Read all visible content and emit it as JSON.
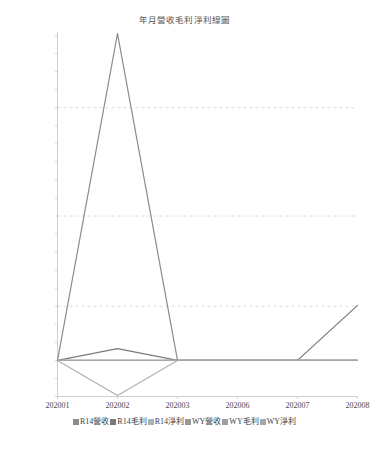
{
  "chart_data": {
    "type": "line",
    "title": "年月營收毛利淨利線圖",
    "xlabel": "",
    "ylabel": "",
    "categories": [
      "202001",
      "202002",
      "202003",
      "202006",
      "202007",
      "202008"
    ],
    "ylim": [
      -400000,
      3600000
    ],
    "ytick_step": 200000,
    "yticks": [
      3600000,
      3400000,
      3200000,
      3000000,
      2800000,
      2600000,
      2400000,
      2200000,
      2000000,
      1800000,
      1600000,
      1400000,
      1200000,
      1000000,
      800000,
      600000,
      400000,
      200000,
      0,
      -200000,
      -400000
    ],
    "ytick_labels": [
      "3600000",
      "3400000",
      "3200000",
      "3000000",
      "2800000",
      "2600000",
      "2400000",
      "2200000",
      "2000000",
      "1800000",
      "1600000",
      "1400000",
      "1200000",
      "1000000",
      "800000",
      "600000",
      "400000",
      "200000",
      "0",
      "-200000",
      "-400000"
    ],
    "grid": "horizontal-dashed",
    "gridlines": [
      2800000,
      1600000,
      600000
    ],
    "legend_position": "bottom",
    "series": [
      {
        "name": "R14營收",
        "color": "#8c8c8c",
        "values": [
          0,
          3620000,
          0,
          0,
          0,
          0
        ]
      },
      {
        "name": "R14毛利",
        "color": "#7a7a7a",
        "values": [
          0,
          130000,
          0,
          0,
          0,
          610000
        ]
      },
      {
        "name": "R14淨利",
        "color": "#b0b0b0",
        "values": [
          0,
          -390000,
          0,
          0,
          0,
          0
        ]
      },
      {
        "name": "WY營收",
        "color": "#999999",
        "values": [
          0,
          0,
          0,
          0,
          0,
          0
        ]
      },
      {
        "name": "WY毛利",
        "color": "#9e9e9e",
        "values": [
          0,
          0,
          0,
          0,
          0,
          0
        ]
      },
      {
        "name": "WY淨利",
        "color": "#a8a8a8",
        "values": [
          0,
          0,
          0,
          0,
          0,
          0
        ]
      }
    ]
  },
  "legend": {
    "items": [
      {
        "label": "R14營收",
        "color": "#8c8c8c"
      },
      {
        "label": "R14毛利",
        "color": "#7a7a7a"
      },
      {
        "label": "R14淨利",
        "color": "#b0b0b0"
      },
      {
        "label": "WY營收",
        "color": "#999999"
      },
      {
        "label": "WY毛利",
        "color": "#9e9e9e"
      },
      {
        "label": "WY淨利",
        "color": "#a8a8a8"
      }
    ]
  },
  "axes": {
    "frame_color": "#c9c9c9",
    "grid_color": "#cfcfd6",
    "tick_color": "#4a4a4a"
  }
}
